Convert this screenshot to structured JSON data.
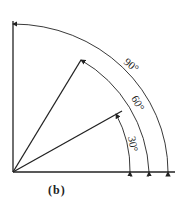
{
  "caption": "(b)",
  "angles": [
    {
      "label": "30°",
      "value": 30
    },
    {
      "label": "60°",
      "value": 60
    },
    {
      "label": "90°",
      "value": 90
    }
  ],
  "colors": {
    "line": "#222222",
    "background": "#ffffff"
  }
}
